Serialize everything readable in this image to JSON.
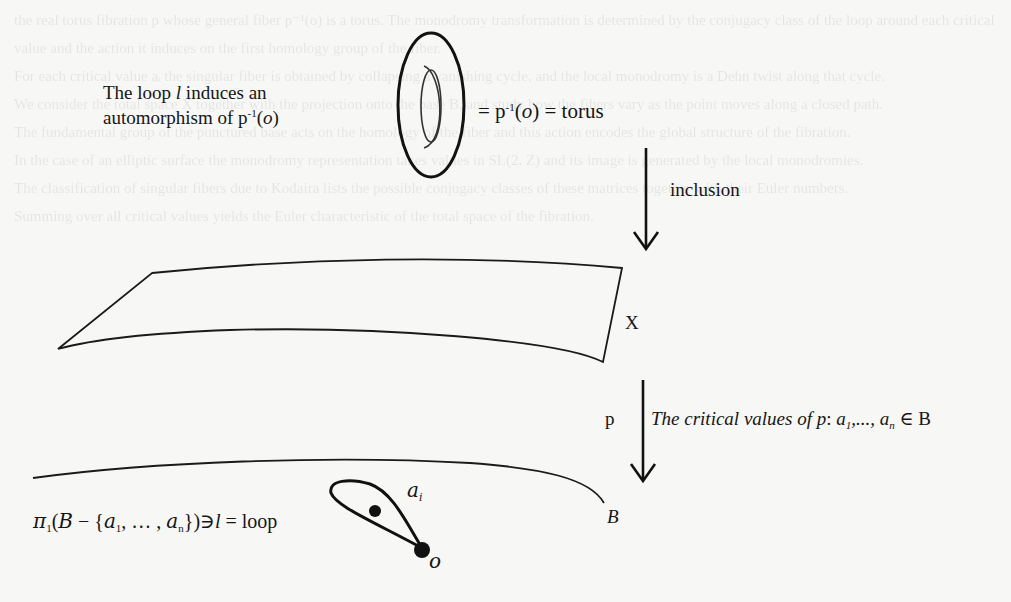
{
  "figure": {
    "type": "fibration-diagram",
    "background_color": "#f7f7f5",
    "ink_color": "#151515"
  },
  "torus_block": {
    "caption_line1_prefix": "The loop ",
    "caption_line1_var": "l",
    "caption_line1_suffix": " induces an",
    "caption_line2_prefix": "automorphism of p",
    "caption_line2_sup": "-1",
    "caption_line2_arg_open": "(",
    "caption_line2_arg": "o",
    "caption_line2_arg_close": ")",
    "equation_prefix": "= p",
    "equation_sup": "-1",
    "equation_open": "(",
    "equation_arg": "o",
    "equation_suffix": ") = torus",
    "shape_icon": "torus-icon"
  },
  "arrow_inclusion": {
    "label": "inclusion",
    "icon": "down-arrow-icon"
  },
  "space_x": {
    "label": "X",
    "shape_icon": "plane-surface-icon"
  },
  "arrow_p": {
    "label": "p",
    "icon": "down-arrow-icon",
    "caption_prefix": "The critical values of ",
    "caption_map": "p",
    "caption_colon": ": ",
    "caption_a1": "a",
    "caption_a1_sub": "1",
    "caption_dots": ",..., ",
    "caption_an": "a",
    "caption_an_sub": "n",
    "caption_suffix": " ∈ B"
  },
  "base_b": {
    "label": "B",
    "shape_icon": "base-curve-icon"
  },
  "fundamental_group": {
    "pi": "π",
    "pi_sub": "1",
    "open": "(",
    "space": "B",
    "minus": " − {",
    "a1": "a",
    "a1_sub": "1",
    "dots": ", … , ",
    "an": "a",
    "an_sub": "n",
    "close": "})",
    "ni": "∋",
    "loop_var": "l",
    "equals": " = loop"
  },
  "loop_figure": {
    "critical_point_label": "a",
    "critical_point_sub": "i",
    "base_point_label": "o",
    "shape_icon": "loop-teardrop-icon"
  },
  "bleed_through_text": "the real torus fibration p whose general fiber p⁻¹(o) is a torus. The monodromy transformation is determined by the conjugacy class of the loop around each critical value and the action it induces on the first homology group of the fiber.\nFor each critical value aᵢ the singular fiber is obtained by collapsing a vanishing cycle, and the local monodromy is a Dehn twist along that cycle.\nWe consider the total space X together with the projection onto the base B, and study how the fibers vary as the point moves along a closed path.\nThe fundamental group of the punctured base acts on the homology of the fiber and this action encodes the global structure of the fibration.\nIn the case of an elliptic surface the monodromy representation takes values in SL(2, Z) and its image is generated by the local monodromies.\nThe classification of singular fibers due to Kodaira lists the possible conjugacy classes of these matrices together with their Euler numbers.\nSumming over all critical values yields the Euler characteristic of the total space of the fibration."
}
